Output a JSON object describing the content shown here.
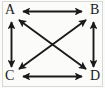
{
  "figure": {
    "kind": "directed-graph-diagram",
    "background_color": "#fbfbfa",
    "stroke_color": "#1a1a1a",
    "label_color": "#1a1a1a",
    "border_color": "#d8d8d6"
  },
  "graph": {
    "vertices": [
      {
        "id": "A",
        "label": "A",
        "x": 14,
        "y": 14,
        "corner": "top-left"
      },
      {
        "id": "B",
        "label": "B",
        "x": 91,
        "y": 14,
        "corner": "top-right"
      },
      {
        "id": "C",
        "label": "C",
        "x": 14,
        "y": 75,
        "corner": "bottom-left"
      },
      {
        "id": "D",
        "label": "D",
        "x": 91,
        "y": 75,
        "corner": "bottom-right"
      }
    ],
    "edges": [
      {
        "id": "AB",
        "from": "A",
        "to": "B",
        "style": "double-arrow",
        "kind": "horizontal-top"
      },
      {
        "id": "CD",
        "from": "C",
        "to": "D",
        "style": "double-arrow",
        "kind": "horizontal-bottom"
      },
      {
        "id": "AC",
        "from": "A",
        "to": "C",
        "style": "double-arrow",
        "kind": "vertical-left"
      },
      {
        "id": "BD",
        "from": "B",
        "to": "D",
        "style": "double-arrow",
        "kind": "vertical-right"
      },
      {
        "id": "AD",
        "from": "A",
        "to": "D",
        "style": "double-arrow",
        "kind": "diagonal"
      },
      {
        "id": "BC",
        "from": "B",
        "to": "C",
        "style": "double-arrow",
        "kind": "diagonal"
      }
    ],
    "edge_count": 6,
    "vertex_count": 4,
    "all_edges_bidirectional": true
  }
}
